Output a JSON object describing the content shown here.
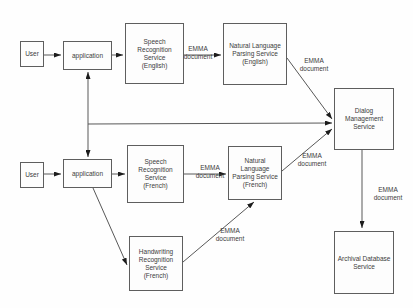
{
  "diagram": {
    "nodes": [
      {
        "id": "user-english",
        "label": "User"
      },
      {
        "id": "application-english",
        "label": "application"
      },
      {
        "id": "speech-recognition-english",
        "label": "Speech\nRecognition\nService\n(English)"
      },
      {
        "id": "nlp-english",
        "label": "Natural Language\nParsing Service\n(English)"
      },
      {
        "id": "dialog-management",
        "label": "Dialog\nManagement\nService"
      },
      {
        "id": "user-french",
        "label": "User"
      },
      {
        "id": "application-french",
        "label": "application"
      },
      {
        "id": "speech-recognition-french",
        "label": "Speech\nRecognition\nService\n(French)"
      },
      {
        "id": "nlp-french",
        "label": "Natural\nLanguage\nParsing Service\n(French)"
      },
      {
        "id": "handwriting-recognition-french",
        "label": "Handwriting\nRecognition\nService\n(French)"
      },
      {
        "id": "archival-database",
        "label": "Archival Database\nService"
      }
    ],
    "edge_labels": [
      "EMMA\ndocument",
      "EMMA\ndocument",
      "EMMA\ndocument",
      "EMMA\ndocument",
      "EMMA\ndocument",
      "EMMA\ndocument"
    ]
  }
}
